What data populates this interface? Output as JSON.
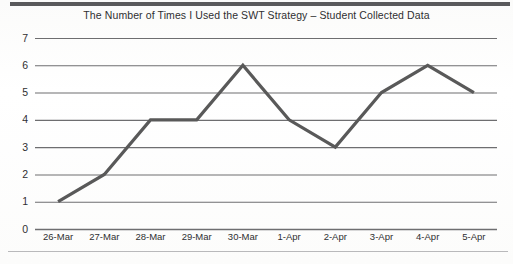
{
  "chart_data": {
    "type": "line",
    "title": "The Number of Times I Used the SWT Strategy – Student Collected Data",
    "xlabel": "",
    "ylabel": "",
    "categories": [
      "26-Mar",
      "27-Mar",
      "28-Mar",
      "29-Mar",
      "30-Mar",
      "1-Apr",
      "2-Apr",
      "3-Apr",
      "4-Apr",
      "5-Apr"
    ],
    "values": [
      1,
      2,
      4,
      4,
      6,
      4,
      3,
      5,
      6,
      5
    ],
    "ylim": [
      0,
      7
    ],
    "yticks": [
      "0",
      "1",
      "2",
      "3",
      "4",
      "5",
      "6",
      "7"
    ],
    "grid": true,
    "legend": false,
    "series": [
      {
        "name": "Times SWT Strategy Used",
        "values": [
          1,
          2,
          4,
          4,
          6,
          4,
          3,
          5,
          6,
          5
        ]
      }
    ],
    "colors": {
      "line": "#595959",
      "grid": "#6e6e70",
      "text": "#2f2f31",
      "background": "#fdfdfc",
      "top_rule": "#59595b",
      "bottom_rule": "#b9b9bb"
    }
  }
}
